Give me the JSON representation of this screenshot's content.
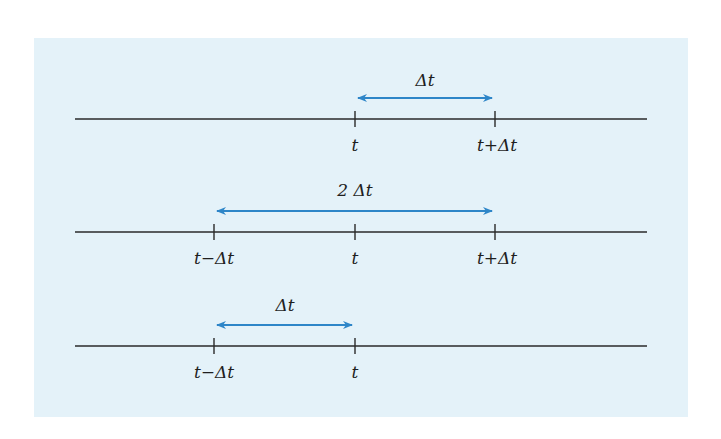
{
  "colors": {
    "background": "#e4f2f9",
    "axis": "#2a2a2a",
    "arrow": "#2e86c8"
  },
  "rows": [
    {
      "arrow_label": "Δt",
      "ticks": [
        {
          "label": "t"
        },
        {
          "label": "t+Δt"
        }
      ]
    },
    {
      "arrow_label": "2 Δt",
      "ticks": [
        {
          "label": "t−Δt"
        },
        {
          "label": "t"
        },
        {
          "label": "t+Δt"
        }
      ]
    },
    {
      "arrow_label": "Δt",
      "ticks": [
        {
          "label": "t−Δt"
        },
        {
          "label": "t"
        }
      ]
    }
  ]
}
